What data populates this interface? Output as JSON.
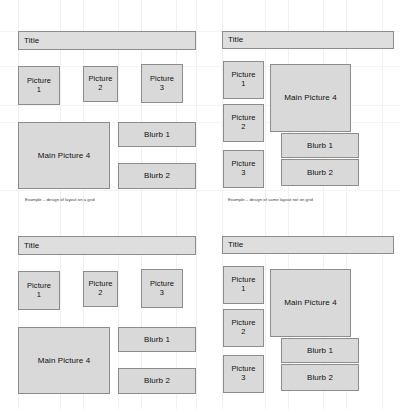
{
  "document": {
    "kind": "wireframe-layout-comparison",
    "panels": [
      {
        "id": "top-left",
        "title_label": "Title",
        "pictures": [
          "Picture\n1",
          "Picture\n2",
          "Picture\n3"
        ],
        "main_label": "Main Picture 4",
        "blurbs": [
          "Blurb 1",
          "Blurb 2"
        ],
        "caption": "Example – design of layout on a grid"
      },
      {
        "id": "top-right",
        "title_label": "Title",
        "pictures": [
          "Picture\n1",
          "Picture\n2",
          "Picture\n3"
        ],
        "main_label": "Main Picture 4",
        "blurbs": [
          "Blurb 1",
          "Blurb 2"
        ],
        "caption": "Example – design of same layout not on grid"
      },
      {
        "id": "bottom-left",
        "title_label": "Title",
        "pictures": [
          "Picture\n1",
          "Picture\n2",
          "Picture\n3"
        ],
        "main_label": "Main Picture 4",
        "blurbs": [
          "Blurb 1",
          "Blurb 2"
        ],
        "caption": ""
      },
      {
        "id": "bottom-right",
        "title_label": "Title",
        "pictures": [
          "Picture\n1",
          "Picture\n2",
          "Picture\n3"
        ],
        "main_label": "Main Picture 4",
        "blurbs": [
          "Blurb 1",
          "Blurb 2"
        ],
        "caption": ""
      }
    ],
    "colors": {
      "page_background": "#ffffff",
      "box_fill": "#d9d9d9",
      "title_fill": "#dedede",
      "box_border": "#8c8c8c",
      "text": "#111111",
      "grid_line": "#f0f0f0"
    }
  }
}
